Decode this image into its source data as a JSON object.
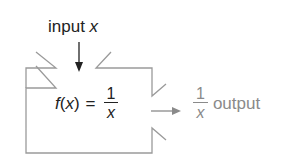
{
  "diagram": {
    "input": {
      "label": "input",
      "variable": "x"
    },
    "function": {
      "name": "f",
      "arg": "x",
      "equals": "=",
      "numerator": "1",
      "denominator": "x"
    },
    "output": {
      "numerator": "1",
      "denominator": "x",
      "label": "output"
    },
    "colors": {
      "box": "#9a9a9a",
      "arrow_in": "#222222",
      "arrow_out": "#8a8a8a",
      "text": "#222222",
      "output_text": "#8a8a8a"
    }
  }
}
